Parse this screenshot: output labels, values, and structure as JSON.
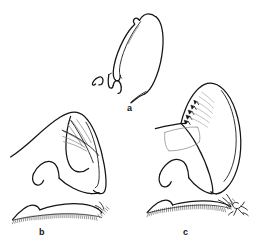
{
  "figure": {
    "kind": "scientific-line-drawing-plate",
    "background_color": "#ffffff",
    "panel_count": 3,
    "ink_color": "#141414",
    "shading_color": "#8a8a8a",
    "hair_fringe_color": "#3c3c3c"
  },
  "panels": [
    {
      "id": "a",
      "label": "a",
      "label_x": 127,
      "label_y": 104,
      "position": "top-center",
      "notes": "Narrow elongate lobe, pointed apex downward, with inner parallel outline and small hook-shaped appendage at lower left"
    },
    {
      "id": "b",
      "label": "b",
      "label_x": 39,
      "label_y": 228,
      "position": "bottom-left",
      "notes": "Broad rounded lobe with diagonal cross-hatching on dorsal surface, inner hook process and basal hair fringe along lower margin"
    },
    {
      "id": "c",
      "label": "c",
      "label_x": 183,
      "label_y": 228,
      "position": "bottom-right",
      "notes": "Curved hook-shaped lobe with serrate toothed margin, pale membranous flap, radiating striae and basal hair fringe"
    }
  ],
  "signature": {
    "present": true,
    "type": "artist-monogram",
    "x": 232,
    "y": 206,
    "description": "Small hand-drawn monogram at lower right corner of plate"
  },
  "colors": {
    "ink": "#141414",
    "light_ink": "#555555",
    "shading": "#8a8a8a",
    "background": "#ffffff"
  }
}
